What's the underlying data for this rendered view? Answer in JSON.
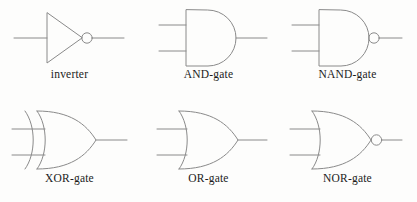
{
  "diagram": {
    "type": "logic-gate-symbol-chart",
    "background_color": "#fdfdfc",
    "stroke_color": "#8a8a8a",
    "label_color": "#1b1b1b",
    "stroke_width": 1,
    "columns": 3,
    "rows": 2,
    "gates": [
      {
        "id": "inverter",
        "label": "inverter",
        "shape": "triangle",
        "inputs": 1,
        "inverted_output": true,
        "row": 0,
        "column": 0
      },
      {
        "id": "and-gate",
        "label": "AND-gate",
        "shape": "d-shape",
        "inputs": 2,
        "inverted_output": false,
        "row": 0,
        "column": 1
      },
      {
        "id": "nand-gate",
        "label": "NAND-gate",
        "shape": "d-shape",
        "inputs": 2,
        "inverted_output": true,
        "row": 0,
        "column": 2
      },
      {
        "id": "xor-gate",
        "label": "XOR-gate",
        "shape": "curved-shield-double-arc",
        "inputs": 2,
        "inverted_output": false,
        "row": 1,
        "column": 0
      },
      {
        "id": "or-gate",
        "label": "OR-gate",
        "shape": "curved-shield",
        "inputs": 2,
        "inverted_output": false,
        "row": 1,
        "column": 1
      },
      {
        "id": "nor-gate",
        "label": "NOR-gate",
        "shape": "curved-shield",
        "inputs": 2,
        "inverted_output": true,
        "row": 1,
        "column": 2
      }
    ]
  }
}
